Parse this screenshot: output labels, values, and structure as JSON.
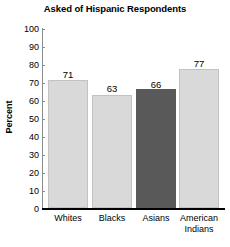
{
  "chart_data": {
    "type": "bar",
    "title": "Asked of Hispanic Respondents",
    "xlabel": "",
    "ylabel": "Percent",
    "categories": [
      "Whites",
      "Blacks",
      "Asians",
      "American Indians"
    ],
    "category_lines": [
      [
        "Whites"
      ],
      [
        "Blacks"
      ],
      [
        "Asians"
      ],
      [
        "American",
        "Indians"
      ]
    ],
    "values": [
      71,
      63,
      66,
      77
    ],
    "value_labels": [
      "71",
      "63",
      "66",
      "77"
    ],
    "ylim": [
      0,
      100
    ],
    "yticks": [
      100,
      90,
      80,
      70,
      60,
      50,
      40,
      30,
      20,
      10,
      0
    ],
    "ytick_labels": [
      "100",
      "90",
      "80",
      "70",
      "60",
      "50",
      "40",
      "30",
      "20",
      "10",
      "0"
    ],
    "grid": false,
    "legend": null,
    "bar_colors": [
      "#d9d9d9",
      "#d9d9d9",
      "#595959",
      "#d9d9d9"
    ],
    "highlight_category": "Asians",
    "axis_color": "#000000"
  }
}
